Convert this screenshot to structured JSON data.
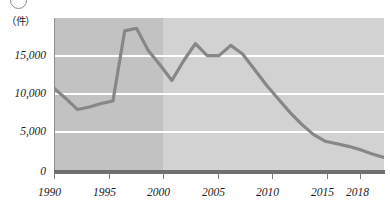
{
  "figure": {
    "marker_label": "circle-outline-mark",
    "unit_label": "（件）"
  },
  "chart_data": {
    "type": "line",
    "title": "",
    "subtitle": "",
    "xlabel": "",
    "ylabel": "（件）",
    "unit": "件",
    "grid": true,
    "legend_position": "none",
    "xlim": [
      1990,
      2018
    ],
    "ylim": [
      0,
      18000
    ],
    "y_ticks": [
      0,
      5000,
      10000,
      15000
    ],
    "y_tick_labels": [
      "0",
      "5,000",
      "10,000",
      "15,000"
    ],
    "x_ticks": [
      1990,
      1995,
      2000,
      2005,
      2010,
      2015,
      2018
    ],
    "x_tick_labels": [
      "1990",
      "1995",
      "2000",
      "2005",
      "2010",
      "2015",
      "2018"
    ],
    "shaded_regions": [
      {
        "name": "earlier-period-band",
        "from": 1990,
        "to": 2000,
        "color": "#c2c2c2"
      },
      {
        "name": "later-period-band",
        "from": 2000,
        "to": 2018,
        "color": "#d2d2d2"
      }
    ],
    "series": [
      {
        "name": "件数",
        "color": "#878787",
        "x": [
          1990,
          1991,
          1992,
          1993,
          1994,
          1995,
          1996,
          1997,
          1998,
          1999,
          2000,
          2001,
          2002,
          2003,
          2004,
          2005,
          2006,
          2007,
          2008,
          2009,
          2010,
          2011,
          2012,
          2013,
          2014,
          2015,
          2016,
          2017,
          2018
        ],
        "values": [
          9800,
          8600,
          7300,
          7600,
          8000,
          8300,
          16500,
          16800,
          14200,
          12500,
          10700,
          13000,
          15000,
          13600,
          13600,
          14800,
          13800,
          12000,
          10200,
          8600,
          7000,
          5600,
          4400,
          3600,
          3300,
          3000,
          2600,
          2100,
          1700
        ]
      }
    ]
  }
}
